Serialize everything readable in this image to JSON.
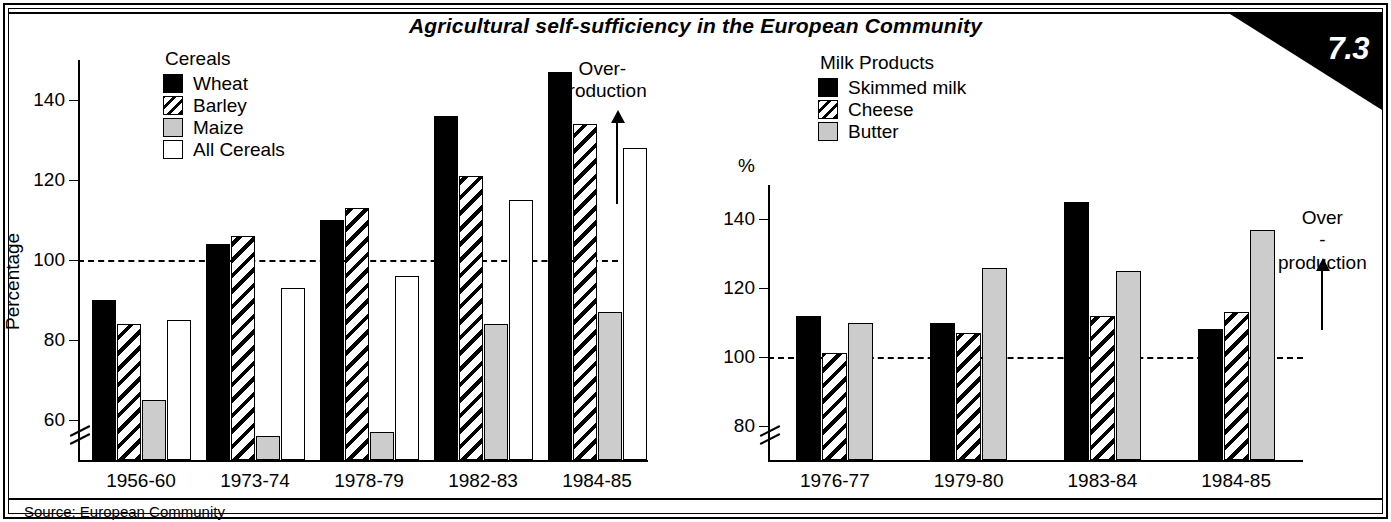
{
  "title": "Agricultural self-sufficiency in the European Community",
  "badge": "7.3",
  "source": "Source: European Community",
  "legend_left": {
    "title": "Cereals",
    "items": [
      {
        "label": "Wheat",
        "pattern": "solid",
        "color": "#000000"
      },
      {
        "label": "Barley",
        "pattern": "hatch",
        "color": "#000000"
      },
      {
        "label": "Maize",
        "pattern": "gray",
        "color": "#c9c9c9"
      },
      {
        "label": "All Cereals",
        "pattern": "white",
        "color": "#ffffff"
      }
    ]
  },
  "legend_right": {
    "title": "Milk Products",
    "items": [
      {
        "label": "Skimmed milk",
        "pattern": "solid",
        "color": "#000000"
      },
      {
        "label": "Cheese",
        "pattern": "hatch",
        "color": "#000000"
      },
      {
        "label": "Butter",
        "pattern": "gray",
        "color": "#c9c9c9"
      }
    ]
  },
  "annotations": {
    "left_overproduction_line1": "Over-",
    "left_overproduction_line2": "production",
    "right_overproduction_line1": "Over",
    "right_overproduction_line2": "-production"
  },
  "chart_data": [
    {
      "id": "cereals",
      "type": "bar",
      "title": "Cereals",
      "xlabel": "",
      "ylabel": "Percentage",
      "ylim": [
        50,
        150
      ],
      "yticks": [
        60,
        80,
        100,
        120,
        140
      ],
      "ytick_labels": [
        "60",
        "80",
        "100",
        "120",
        "140"
      ],
      "axis_break": true,
      "reference_line": 100,
      "grid": false,
      "legend_position": "top-left",
      "categories": [
        "1956-60",
        "1973-74",
        "1978-79",
        "1982-83",
        "1984-85"
      ],
      "series": [
        {
          "name": "Wheat",
          "values": [
            90,
            104,
            110,
            136,
            147
          ]
        },
        {
          "name": "Barley",
          "values": [
            84,
            106,
            113,
            121,
            134
          ]
        },
        {
          "name": "Maize",
          "values": [
            65,
            56,
            57,
            84,
            87
          ]
        },
        {
          "name": "All Cereals",
          "values": [
            85,
            93,
            96,
            115,
            128
          ]
        }
      ]
    },
    {
      "id": "milk-products",
      "type": "bar",
      "title": "Milk Products",
      "xlabel": "",
      "ylabel": "%",
      "ylim": [
        70,
        150
      ],
      "yticks": [
        80,
        100,
        120,
        140
      ],
      "ytick_labels": [
        "80",
        "100",
        "120",
        "140"
      ],
      "axis_break": true,
      "reference_line": 100,
      "grid": false,
      "legend_position": "top-left",
      "categories": [
        "1976-77",
        "1979-80",
        "1983-84",
        "1984-85"
      ],
      "series": [
        {
          "name": "Skimmed milk",
          "values": [
            112,
            110,
            145,
            108
          ]
        },
        {
          "name": "Cheese",
          "values": [
            101,
            107,
            112,
            113
          ]
        },
        {
          "name": "Butter",
          "values": [
            110,
            126,
            125,
            137
          ]
        }
      ]
    }
  ]
}
